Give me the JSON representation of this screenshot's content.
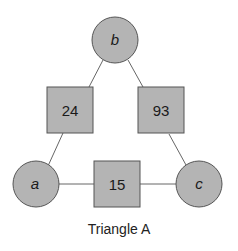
{
  "diagram": {
    "caption": "Triangle A",
    "colors": {
      "fill": "#b4b4b4",
      "stroke": "#555555",
      "line": "#666666",
      "text": "#1a1a1a"
    },
    "nodes": [
      {
        "id": "b",
        "label": "b",
        "shape": "circle",
        "cx": 115,
        "cy": 40,
        "r": 23
      },
      {
        "id": "a",
        "label": "a",
        "shape": "circle",
        "cx": 36,
        "cy": 184,
        "r": 23
      },
      {
        "id": "c",
        "label": "c",
        "shape": "circle",
        "cx": 199,
        "cy": 184,
        "r": 23
      }
    ],
    "edges": [
      {
        "id": "ab",
        "label": "24",
        "x": 47,
        "y": 87,
        "size": 46
      },
      {
        "id": "bc",
        "label": "93",
        "x": 138,
        "y": 87,
        "size": 46
      },
      {
        "id": "ac",
        "label": "15",
        "x": 94,
        "y": 161,
        "size": 46
      }
    ]
  }
}
